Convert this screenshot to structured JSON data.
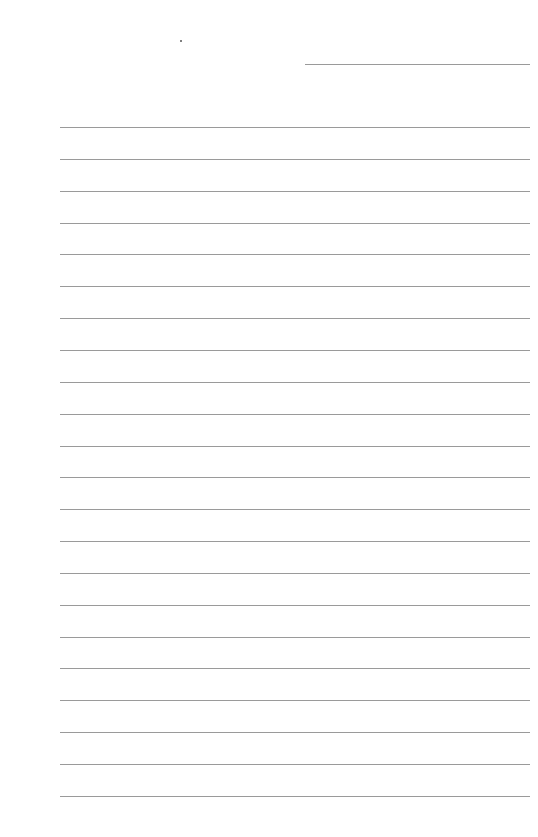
{
  "page": {
    "type": "lined-paper",
    "background": "#ffffff",
    "line_color": "#9a9a9a",
    "header_line": {
      "x": 305,
      "y": 64,
      "width": 225
    },
    "ruled_lines": {
      "count": 22,
      "start_y": 127,
      "spacing": 31.85,
      "x": 60,
      "width": 470
    }
  }
}
